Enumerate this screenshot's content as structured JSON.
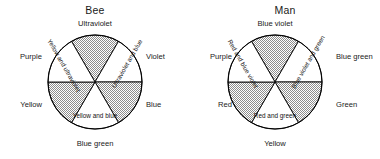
{
  "figure": {
    "colors": {
      "ink": "#1a1a1a",
      "outline": "#000000",
      "shaded_wedge_fill": "#b9b9b9",
      "plain_wedge_fill": "#ffffff",
      "background": "#ffffff"
    }
  },
  "wheels": [
    {
      "id": "bee",
      "title": "Bee",
      "outer_labels": {
        "top": "Ultraviolet",
        "upper_right": "Violet",
        "lower_right": "Blue",
        "bottom": "Blue green",
        "lower_left": "Yellow",
        "upper_left": "Purple"
      },
      "inner_labels": {
        "upper_left": "Yellow and ultraviolet",
        "upper_right": "Ultraviolet and blue",
        "bottom": "Yellow and blue"
      },
      "wedges": [
        {
          "position": "top",
          "shaded": true
        },
        {
          "position": "upper_right",
          "shaded": false
        },
        {
          "position": "lower_right",
          "shaded": true
        },
        {
          "position": "bottom",
          "shaded": false
        },
        {
          "position": "lower_left",
          "shaded": true
        },
        {
          "position": "upper_left",
          "shaded": false
        }
      ]
    },
    {
      "id": "man",
      "title": "Man",
      "outer_labels": {
        "top": "Blue violet",
        "upper_right": "Blue green",
        "lower_right": "Green",
        "bottom": "Yellow",
        "lower_left": "Red",
        "upper_left": "Purple"
      },
      "inner_labels": {
        "upper_left": "Red and blue violet",
        "upper_right": "Blue violet and green",
        "bottom": "Red and green"
      },
      "wedges": [
        {
          "position": "top",
          "shaded": true
        },
        {
          "position": "upper_right",
          "shaded": false
        },
        {
          "position": "lower_right",
          "shaded": true
        },
        {
          "position": "bottom",
          "shaded": false
        },
        {
          "position": "lower_left",
          "shaded": true
        },
        {
          "position": "upper_left",
          "shaded": false
        }
      ]
    }
  ]
}
